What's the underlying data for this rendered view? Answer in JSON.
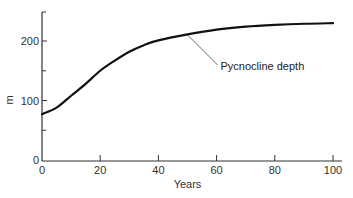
{
  "chart_data": {
    "type": "line",
    "title": "",
    "xlabel": "Years",
    "ylabel": "m",
    "xlim": [
      0,
      100
    ],
    "ylim": [
      0,
      250
    ],
    "x_ticks": [
      0,
      20,
      40,
      60,
      80,
      100
    ],
    "y_ticks": [
      0,
      100,
      200
    ],
    "y_minor_ticks": [
      50,
      150
    ],
    "grid": false,
    "legend": null,
    "series": [
      {
        "name": "Pycnocline depth",
        "x": [
          0,
          5,
          10,
          15,
          20,
          25,
          30,
          35,
          40,
          50,
          60,
          70,
          80,
          90,
          100
        ],
        "values": [
          77,
          88,
          108,
          128,
          150,
          167,
          182,
          193,
          201,
          211,
          219,
          224,
          227,
          229,
          230
        ]
      }
    ],
    "annotations": [
      {
        "text": "Pycnocline depth",
        "points_to": {
          "x": 50,
          "y": 212
        }
      }
    ]
  },
  "colors": {
    "line": "#111111",
    "axis": "#333333",
    "text": "#333333"
  }
}
